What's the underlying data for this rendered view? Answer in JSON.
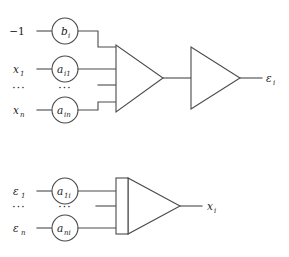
{
  "figure": {
    "stroke_color": "#4a4a4a",
    "text_color": "#1c1c1c",
    "background": "#ffffff"
  },
  "forward_unit": {
    "name": "forward-neuron",
    "inputs": [
      {
        "signal": "−1",
        "weight_base": "b",
        "weight_sub": "i"
      },
      {
        "signal": "x",
        "signal_sub": "1",
        "weight_base": "a",
        "weight_sub": "i1"
      },
      {
        "signal": "…",
        "weight_base": "…",
        "weight_sub": ""
      },
      {
        "signal": "x",
        "signal_sub": "n",
        "weight_base": "a",
        "weight_sub": "in"
      }
    ],
    "summing_block": "triangle",
    "activation_block": "triangle",
    "output": {
      "base": "ε",
      "sub": "i"
    }
  },
  "backward_unit": {
    "name": "backward-neuron",
    "inputs": [
      {
        "signal": "ε",
        "signal_sub": "1",
        "weight_base": "a",
        "weight_sub": "1i"
      },
      {
        "signal": "…",
        "weight_base": "…",
        "weight_sub": ""
      },
      {
        "signal": "ε",
        "signal_sub": "n",
        "weight_base": "a",
        "weight_sub": "ni"
      }
    ],
    "summing_block": "barred-triangle",
    "output": {
      "base": "x",
      "sub": "i"
    }
  },
  "labels": {
    "minus_one": "−1",
    "bias_base": "b",
    "bias_sub": "i",
    "x1_base": "x",
    "x1_sub": "1",
    "xn_base": "x",
    "xn_sub": "n",
    "ai1_base": "a",
    "ai1_sub": "i1",
    "ain_base": "a",
    "ain_sub": "in",
    "eps_out_base": "ε",
    "eps_out_sub": "i",
    "eps1_base": "ε",
    "eps1_sub": "1",
    "epsn_base": "ε",
    "epsn_sub": "n",
    "a1i_base": "a",
    "a1i_sub": "1i",
    "ani_base": "a",
    "ani_sub": "ni",
    "x_out_base": "x",
    "x_out_sub": "i",
    "ellipsis": "···"
  }
}
